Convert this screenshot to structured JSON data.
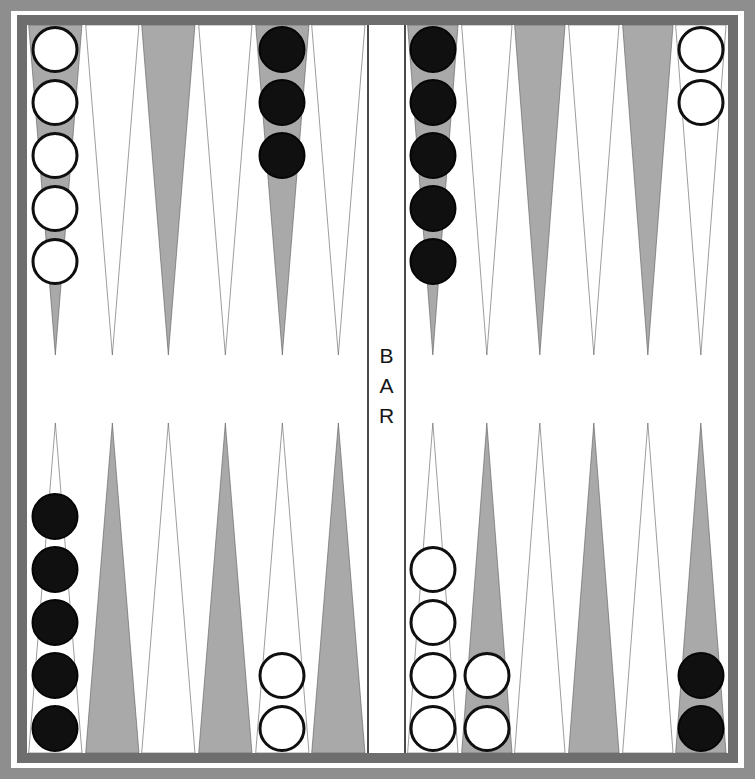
{
  "board": {
    "title": "Backgammon Board",
    "bar_label_letters": [
      "B",
      "A",
      "R"
    ],
    "colors": {
      "point_shaded": "#a9a9a9",
      "point_light": "#ffffff",
      "point_outline": "#5a5a5a",
      "checker_black": "#101010",
      "checker_white": "#ffffff",
      "checker_outline": "#0f0f0f",
      "frame_outer": "#8e8e8e",
      "frame_inner": "#6e6e6e",
      "bar_line": "#4a4a4a",
      "field_background": "#ffffff"
    }
  },
  "quadrants": {
    "top_left": {
      "name": "top-left-quadrant",
      "points": [
        {
          "index": 1,
          "shade": "shaded",
          "checker_color": "white",
          "checker_count": 5
        },
        {
          "index": 2,
          "shade": "light",
          "checker_color": "none",
          "checker_count": 0
        },
        {
          "index": 3,
          "shade": "shaded",
          "checker_color": "none",
          "checker_count": 0
        },
        {
          "index": 4,
          "shade": "light",
          "checker_color": "none",
          "checker_count": 0
        },
        {
          "index": 5,
          "shade": "shaded",
          "checker_color": "black",
          "checker_count": 3
        },
        {
          "index": 6,
          "shade": "light",
          "checker_color": "none",
          "checker_count": 0
        }
      ]
    },
    "top_right": {
      "name": "top-right-quadrant",
      "points": [
        {
          "index": 7,
          "shade": "shaded",
          "checker_color": "black",
          "checker_count": 5
        },
        {
          "index": 8,
          "shade": "light",
          "checker_color": "none",
          "checker_count": 0
        },
        {
          "index": 9,
          "shade": "shaded",
          "checker_color": "none",
          "checker_count": 0
        },
        {
          "index": 10,
          "shade": "light",
          "checker_color": "none",
          "checker_count": 0
        },
        {
          "index": 11,
          "shade": "shaded",
          "checker_color": "none",
          "checker_count": 0
        },
        {
          "index": 12,
          "shade": "light",
          "checker_color": "white",
          "checker_count": 2
        }
      ]
    },
    "bottom_left": {
      "name": "bottom-left-quadrant",
      "points": [
        {
          "index": 13,
          "shade": "light",
          "checker_color": "black",
          "checker_count": 5
        },
        {
          "index": 14,
          "shade": "shaded",
          "checker_color": "none",
          "checker_count": 0
        },
        {
          "index": 15,
          "shade": "light",
          "checker_color": "none",
          "checker_count": 0
        },
        {
          "index": 16,
          "shade": "shaded",
          "checker_color": "none",
          "checker_count": 0
        },
        {
          "index": 17,
          "shade": "light",
          "checker_color": "white",
          "checker_count": 2
        },
        {
          "index": 18,
          "shade": "shaded",
          "checker_color": "none",
          "checker_count": 0
        }
      ]
    },
    "bottom_right": {
      "name": "bottom-right-quadrant",
      "points": [
        {
          "index": 19,
          "shade": "light",
          "checker_color": "white",
          "checker_count": 4
        },
        {
          "index": 20,
          "shade": "shaded",
          "checker_color": "white",
          "checker_count": 2
        },
        {
          "index": 21,
          "shade": "light",
          "checker_color": "none",
          "checker_count": 0
        },
        {
          "index": 22,
          "shade": "shaded",
          "checker_color": "none",
          "checker_count": 0
        },
        {
          "index": 23,
          "shade": "light",
          "checker_color": "none",
          "checker_count": 0
        },
        {
          "index": 24,
          "shade": "shaded",
          "checker_color": "black",
          "checker_count": 2
        }
      ]
    }
  },
  "summary": {
    "total_white_checkers": 15,
    "total_black_checkers": 15,
    "checkers_on_bar": 0
  }
}
